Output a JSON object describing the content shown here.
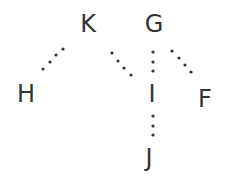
{
  "diagram": {
    "type": "tree",
    "colors": {
      "text": "#333333",
      "dots": "#333333",
      "background": "#ffffff"
    },
    "nodes": [
      {
        "id": "K",
        "label": "K",
        "x": 88,
        "y": 24
      },
      {
        "id": "G",
        "label": "G",
        "x": 154,
        "y": 24
      },
      {
        "id": "H",
        "label": "H",
        "x": 26,
        "y": 94
      },
      {
        "id": "I",
        "label": "I",
        "x": 152,
        "y": 94
      },
      {
        "id": "F",
        "label": "F",
        "x": 205,
        "y": 99
      },
      {
        "id": "J",
        "label": "J",
        "x": 149,
        "y": 158
      }
    ],
    "edges": [
      {
        "from": "K",
        "to": "H",
        "style": "dotted",
        "dots": [
          [
            43,
            69
          ],
          [
            50,
            62
          ],
          [
            56,
            55
          ],
          [
            63,
            49
          ]
        ]
      },
      {
        "from": "K",
        "to": "I",
        "style": "dotted",
        "dots": [
          [
            112,
            53
          ],
          [
            118,
            61
          ],
          [
            124,
            68
          ],
          [
            131,
            75
          ]
        ]
      },
      {
        "from": "G",
        "to": "I",
        "style": "dotted",
        "dots": [
          [
            153,
            52
          ],
          [
            153,
            62
          ],
          [
            153,
            71
          ]
        ]
      },
      {
        "from": "G",
        "to": "F",
        "style": "dotted",
        "dots": [
          [
            172,
            51
          ],
          [
            179,
            58
          ],
          [
            185,
            65
          ],
          [
            191,
            72
          ]
        ]
      },
      {
        "from": "I",
        "to": "J",
        "style": "dotted",
        "dots": [
          [
            153,
            116
          ],
          [
            153,
            126
          ],
          [
            153,
            135
          ]
        ]
      }
    ]
  }
}
